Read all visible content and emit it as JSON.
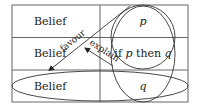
{
  "diagram": {
    "colors": {
      "line": "#3a3a3a",
      "text": "#222222",
      "background": "#ffffff"
    },
    "table": {
      "rows": [
        {
          "left": "Belief",
          "right": {
            "parts": [
              {
                "text": "p",
                "italic": true
              }
            ]
          }
        },
        {
          "left": "Belief",
          "right": {
            "parts": [
              {
                "text": "if ",
                "italic": false
              },
              {
                "text": "p",
                "italic": true
              },
              {
                "text": " then ",
                "italic": false
              },
              {
                "text": "q",
                "italic": true
              }
            ]
          }
        },
        {
          "left": "Belief",
          "right": {
            "parts": [
              {
                "text": "q",
                "italic": true
              }
            ]
          }
        }
      ]
    },
    "arrows": [
      {
        "label": "favour",
        "from": "circle-p-rule",
        "to": "belief-row-3"
      },
      {
        "label": "explain",
        "from": "ellipse-all-right",
        "to": "favour-arrow"
      }
    ],
    "shapes": [
      {
        "name": "circle-p-rule",
        "encloses": [
          "p",
          "if p then q"
        ]
      },
      {
        "name": "tall-ellipse-right",
        "encloses": [
          "p",
          "if p then q",
          "q"
        ]
      },
      {
        "name": "wide-ellipse-bottom",
        "encloses": [
          "Belief",
          "q"
        ]
      }
    ]
  }
}
